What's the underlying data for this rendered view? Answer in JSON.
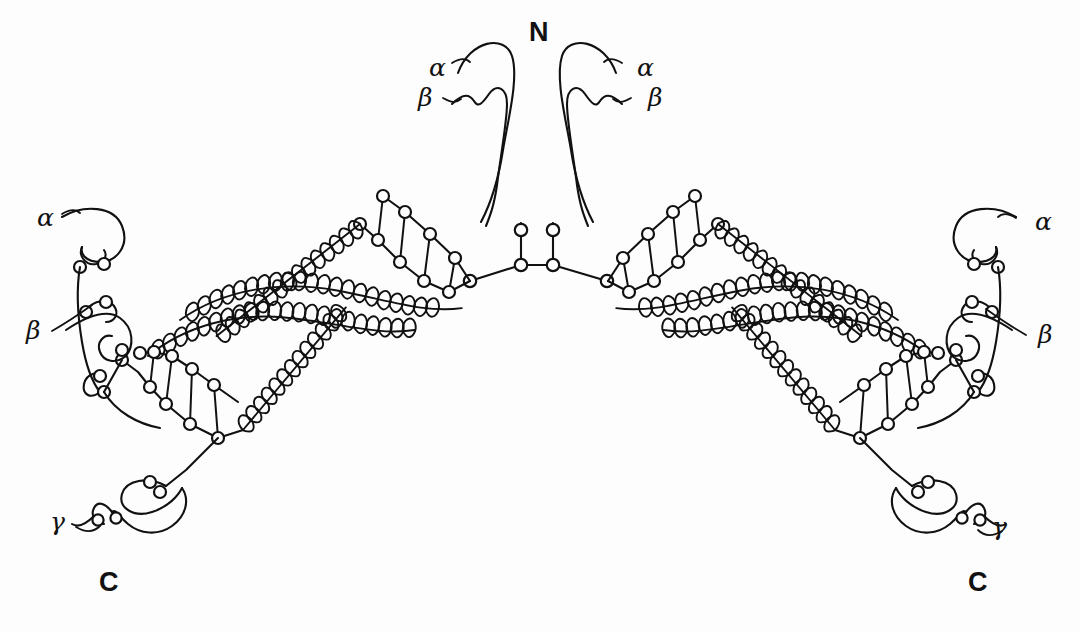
{
  "figure": {
    "kind": "molecular-schematic",
    "background_color": "#fdfdfd",
    "stroke_color": "#111111",
    "width": 1080,
    "height": 632
  },
  "termini": [
    {
      "name": "n-terminus",
      "text": "N",
      "x": 537,
      "y": 33
    },
    {
      "name": "c-terminus-left",
      "text": "C",
      "x": 108,
      "y": 583
    },
    {
      "name": "c-terminus-right",
      "text": "C",
      "x": 977,
      "y": 583
    }
  ],
  "chain_labels": [
    {
      "name": "alpha-top-left",
      "text": "α",
      "x": 437,
      "y": 68
    },
    {
      "name": "beta-top-left",
      "text": "β",
      "x": 426,
      "y": 99
    },
    {
      "name": "alpha-top-right",
      "text": "α",
      "x": 645,
      "y": 68
    },
    {
      "name": "beta-top-right",
      "text": "β",
      "x": 656,
      "y": 99
    },
    {
      "name": "alpha-left",
      "text": "α",
      "x": 45,
      "y": 218
    },
    {
      "name": "beta-left",
      "text": "β",
      "x": 34,
      "y": 332
    },
    {
      "name": "alpha-right",
      "text": "α",
      "x": 1043,
      "y": 222
    },
    {
      "name": "beta-right",
      "text": "β",
      "x": 1046,
      "y": 336
    },
    {
      "name": "gamma-left",
      "text": "γ",
      "x": 58,
      "y": 522
    },
    {
      "name": "beta-right-lower",
      "text": "γ",
      "x": 1000,
      "y": 527
    }
  ],
  "legend": {
    "coil_note": "coiled-coil helical rod",
    "node_note": "globular domain"
  }
}
